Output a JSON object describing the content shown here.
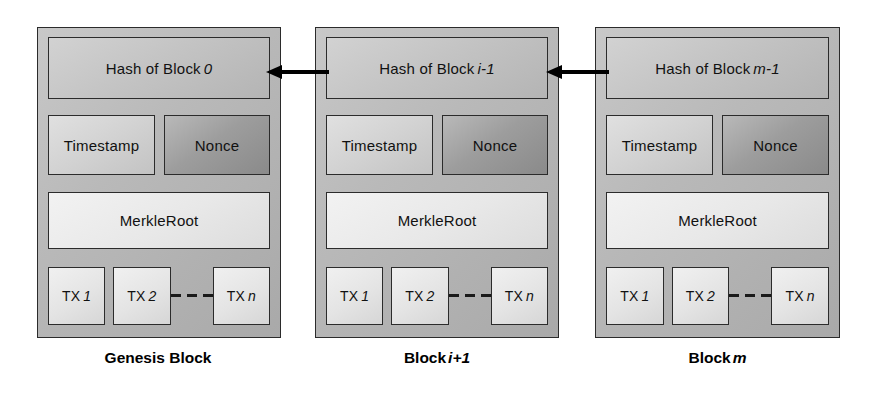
{
  "diagram": {
    "background_color": "#ffffff",
    "colors": {
      "block_fill": "#bdbdbd",
      "hash_fill": "#c4c4c4",
      "timestamp_fill": "#d2d2d2",
      "nonce_fill": "#9d9d9d",
      "merkle_fill": "#e8e8e8",
      "tx_fill": "#e4e4e4",
      "border": "#2b2b2b",
      "arrow": "#000000",
      "text": "#000000"
    }
  },
  "blocks": [
    {
      "caption_prefix": "Genesis Block",
      "caption_var": "",
      "hash_prefix": "Hash of Block",
      "hash_var": "0",
      "timestamp_label": "Timestamp",
      "nonce_label": "Nonce",
      "merkle_label": "MerkleRoot",
      "tx": [
        {
          "prefix": "TX",
          "var": "1"
        },
        {
          "prefix": "TX",
          "var": "2"
        },
        {
          "prefix": "TX",
          "var": "n"
        }
      ],
      "dash_count": 3
    },
    {
      "caption_prefix": "Block",
      "caption_var": "i+1",
      "hash_prefix": "Hash of Block",
      "hash_var": "i-1",
      "timestamp_label": "Timestamp",
      "nonce_label": "Nonce",
      "merkle_label": "MerkleRoot",
      "tx": [
        {
          "prefix": "TX",
          "var": "1"
        },
        {
          "prefix": "TX",
          "var": "2"
        },
        {
          "prefix": "TX",
          "var": "n"
        }
      ],
      "dash_count": 3
    },
    {
      "caption_prefix": "Block",
      "caption_var": "m",
      "hash_prefix": "Hash of Block",
      "hash_var": "m-1",
      "timestamp_label": "Timestamp",
      "nonce_label": "Nonce",
      "merkle_label": "MerkleRoot",
      "tx": [
        {
          "prefix": "TX",
          "var": "1"
        },
        {
          "prefix": "TX",
          "var": "2"
        },
        {
          "prefix": "TX",
          "var": "n"
        }
      ],
      "dash_count": 3
    }
  ],
  "arrows": [
    {
      "name": "arrow-block1-to-block0",
      "direction": "left",
      "from": "Block i+1",
      "to": "Genesis Block"
    },
    {
      "name": "arrow-block2-to-block1",
      "direction": "left",
      "from": "Block m",
      "to": "Block i+1"
    }
  ]
}
